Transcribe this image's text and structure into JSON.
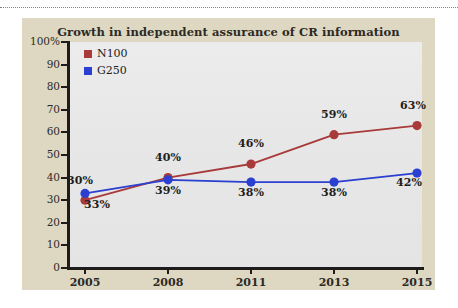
{
  "page": {
    "background": "#ffffff",
    "panel_color": "#ded7c1",
    "plot_background": "#e9e9e9",
    "divider": "dotted-rule"
  },
  "chart_data": {
    "type": "line",
    "title": "Growth in independent assurance of CR information",
    "xlabel": "",
    "ylabel": "",
    "categories": [
      "2005",
      "2008",
      "2011",
      "2013",
      "2015"
    ],
    "series": [
      {
        "name": "N100",
        "color": "#a83a3a",
        "values": [
          30,
          40,
          46,
          59,
          63
        ],
        "labels": [
          "30%",
          "40%",
          "46%",
          "59%",
          "63%"
        ],
        "label_position": "above"
      },
      {
        "name": "G250",
        "color": "#2b3fd0",
        "values": [
          33,
          39,
          38,
          38,
          42
        ],
        "labels": [
          "33%",
          "39%",
          "38%",
          "38%",
          "42%"
        ],
        "label_position": "below"
      }
    ],
    "ylim": [
      0,
      100
    ],
    "y_ticks": [
      0,
      10,
      20,
      30,
      40,
      50,
      60,
      70,
      80,
      90,
      100
    ],
    "y_tick_labels": [
      "0",
      "10",
      "20",
      "30",
      "40",
      "50",
      "60",
      "70",
      "80",
      "90",
      "100%"
    ],
    "x_tick_labels": [
      "2005",
      "2008",
      "2011",
      "2013",
      "2015"
    ],
    "grid": false,
    "legend_position": "top-left",
    "legend": [
      {
        "label": "N100",
        "color": "#a83a3a"
      },
      {
        "label": "G250",
        "color": "#2b3fd0"
      }
    ]
  }
}
